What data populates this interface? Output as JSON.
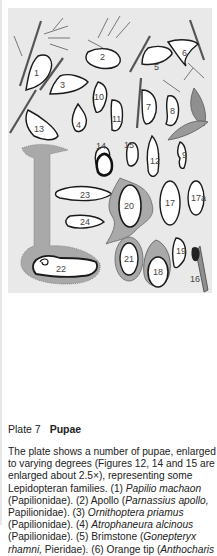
{
  "plate": {
    "figure_labels": [
      "1",
      "2",
      "3",
      "4",
      "5",
      "6",
      "7",
      "8",
      "9",
      "10",
      "11",
      "12",
      "13",
      "14",
      "15",
      "16",
      "17",
      "17a",
      "18",
      "19",
      "20",
      "21",
      "22",
      "23",
      "24"
    ],
    "colors": {
      "background": "#e9e9e9",
      "pupa_fill": "#ffffff",
      "outline": "#1a1a1a",
      "gray_fill": "#a9a9a9",
      "leaf_fill": "#8f8f8f"
    }
  },
  "caption": {
    "plate_label": "Plate 7",
    "plate_title": "Pupae",
    "body_segments": [
      {
        "text": "The plate shows a number of pupae, enlarged to varying degrees (Figures 12, 14 and 15 are enlarged about 2.5×), representing some Lepidopteran families. (1) ",
        "italic": false
      },
      {
        "text": "Papilio machaon",
        "italic": true
      },
      {
        "text": " (Papilionidae). (2) Apollo (",
        "italic": false
      },
      {
        "text": "Parnassius apollo,",
        "italic": true
      },
      {
        "text": " Papilionidae). (3) ",
        "italic": false
      },
      {
        "text": "Ornithoptera priamus",
        "italic": true
      },
      {
        "text": " (Papilionidae). (4) ",
        "italic": false
      },
      {
        "text": "Atrophaneura alcinous",
        "italic": true
      },
      {
        "text": " (Papilionidae). (5) Brimstone (",
        "italic": false
      },
      {
        "text": "Gonepteryx rhamni,",
        "italic": true
      },
      {
        "text": " Pieridae). (6) Orange tip (",
        "italic": false
      },
      {
        "text": "Anthocharis",
        "italic": true
      }
    ]
  }
}
